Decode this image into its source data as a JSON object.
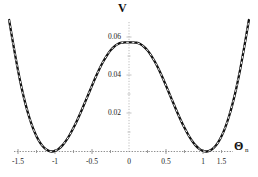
{
  "chart_data": {
    "type": "line",
    "title": "",
    "xlabel": "Θ",
    "xlabel_subscript": "n",
    "ylabel": "V",
    "xlim": [
      -1.62,
      1.62
    ],
    "ylim": [
      -0.004,
      0.0665
    ],
    "grid": false,
    "legend": "none",
    "xticks": [
      -1.5,
      -1,
      -0.5,
      0,
      0.5,
      1,
      1.5
    ],
    "xtick_labels": [
      "-1.5",
      "-1",
      "-0.5",
      "0",
      "0.5",
      "1",
      "1.5"
    ],
    "yticks": [
      0.02,
      0.04,
      0.06
    ],
    "ytick_labels": [
      "0.02",
      "0.04",
      "0.06"
    ],
    "series": [
      {
        "name": "solid-potential-curve",
        "style": "solid",
        "color": "#111111",
        "x": [
          -1.62,
          -1.55,
          -1.5,
          -1.45,
          -1.4,
          -1.35,
          -1.3,
          -1.25,
          -1.2,
          -1.15,
          -1.1,
          -1.05,
          -1.0,
          -0.95,
          -0.9,
          -0.85,
          -0.8,
          -0.75,
          -0.7,
          -0.65,
          -0.6,
          -0.55,
          -0.5,
          -0.45,
          -0.4,
          -0.35,
          -0.3,
          -0.25,
          -0.2,
          -0.15,
          -0.1,
          -0.05,
          0.0,
          0.05,
          0.1,
          0.15,
          0.2,
          0.25,
          0.3,
          0.35,
          0.4,
          0.45,
          0.5,
          0.55,
          0.6,
          0.65,
          0.7,
          0.75,
          0.8,
          0.85,
          0.9,
          0.95,
          1.0,
          1.05,
          1.1,
          1.15,
          1.2,
          1.25,
          1.3,
          1.35,
          1.4,
          1.45,
          1.5,
          1.55,
          1.62
        ],
        "y": [
          0.0689,
          0.0531,
          0.0425,
          0.0332,
          0.0251,
          0.0182,
          0.0125,
          0.008,
          0.0045,
          0.0021,
          0.0006,
          0.0,
          0.0003,
          0.0014,
          0.0032,
          0.0057,
          0.0088,
          0.0124,
          0.0164,
          0.0207,
          0.0253,
          0.0299,
          0.0345,
          0.039,
          0.0432,
          0.047,
          0.0503,
          0.053,
          0.055,
          0.0563,
          0.057,
          0.0572,
          0.0572,
          0.0572,
          0.057,
          0.0563,
          0.055,
          0.053,
          0.0503,
          0.047,
          0.0432,
          0.039,
          0.0345,
          0.0299,
          0.0253,
          0.0207,
          0.0164,
          0.0124,
          0.0088,
          0.0057,
          0.0032,
          0.0014,
          0.0003,
          0.0,
          0.0006,
          0.0021,
          0.0045,
          0.008,
          0.0125,
          0.0182,
          0.0251,
          0.0332,
          0.0425,
          0.0531,
          0.0689
        ]
      },
      {
        "name": "dashed-potential-curve",
        "style": "dashed",
        "color": "#111111",
        "note": "dashed curve overlapping the solid curve"
      }
    ],
    "features": {
      "peak_x": 0,
      "peak_y": 0.0565,
      "minimum_left_x": -1.05,
      "minimum_right_x": 1.05,
      "minimum_y": 0.0
    }
  },
  "axes": {
    "x_axis_color": "#8a8a8a",
    "y_axis_color": "#b5b5b5",
    "axis_line_style": "dotted"
  },
  "colors": {
    "background": "#ffffff",
    "curve": "#111111",
    "text": "#1a1a1a",
    "axis": "#9a9a9a"
  }
}
